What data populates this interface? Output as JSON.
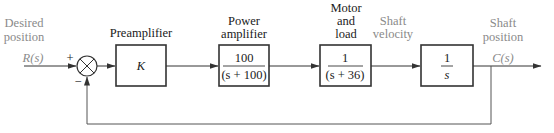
{
  "diagram": {
    "type": "control-system-block-diagram",
    "input": {
      "label_line1": "Desired",
      "label_line2": "position",
      "signal": "R(s)"
    },
    "summing_junction": {
      "plus_sign": "+",
      "minus_sign": "−"
    },
    "blocks": [
      {
        "id": "preamp",
        "title_lines": [
          "Preamplifier"
        ],
        "tf": "K"
      },
      {
        "id": "power-amp",
        "title_lines": [
          "Power",
          "amplifier"
        ],
        "numerator": "100",
        "denominator": "(s + 100)"
      },
      {
        "id": "motor-load",
        "title_lines": [
          "Motor",
          "and",
          "load"
        ],
        "numerator": "1",
        "denominator": "(s + 36)"
      },
      {
        "id": "integrator",
        "title_lines": [],
        "numerator": "1",
        "denominator": "s"
      }
    ],
    "intermediate": {
      "label_line1": "Shaft",
      "label_line2": "velocity"
    },
    "output": {
      "label_line1": "Shaft",
      "label_line2": "position",
      "signal": "C(s)"
    },
    "feedback": "unity negative feedback",
    "colors": {
      "line": "#333333",
      "annotation": "#8a8a8a",
      "text": "#1a1a1a"
    }
  }
}
